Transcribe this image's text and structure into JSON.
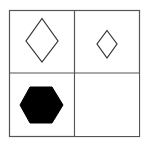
{
  "puzzle": {
    "type": "2x2 matrix reasoning grid",
    "grid": {
      "rows": 2,
      "cols": 2,
      "border_color": "#555555",
      "background": "#ffffff"
    },
    "cells": [
      {
        "row": 0,
        "col": 0,
        "shape": "diamond",
        "size": "large",
        "fill": "none",
        "stroke": "#333333"
      },
      {
        "row": 0,
        "col": 1,
        "shape": "diamond",
        "size": "small",
        "fill": "none",
        "stroke": "#333333"
      },
      {
        "row": 1,
        "col": 0,
        "shape": "hexagon",
        "size": "large",
        "fill": "#000000",
        "stroke": "#000000"
      },
      {
        "row": 1,
        "col": 1,
        "shape": "empty",
        "size": "",
        "fill": "none",
        "stroke": "none"
      }
    ]
  }
}
